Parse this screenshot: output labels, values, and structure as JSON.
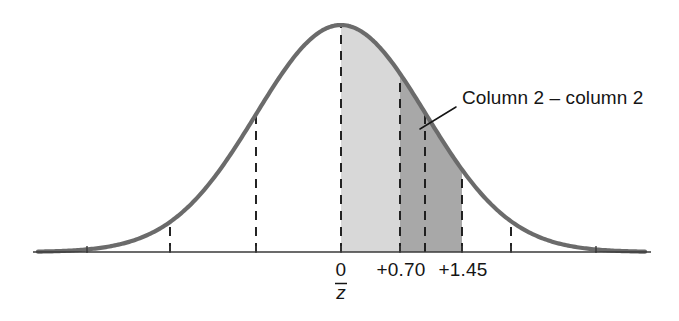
{
  "figure": {
    "background_color": "#ffffff",
    "curve_color": "#6b6b6b",
    "axis_color": "#3a3a3a",
    "dashed_color": "#1a1a1a",
    "light_shade_color": "#d8d8d8",
    "dark_shade_color": "#a8a8a8",
    "text_color": "#151515"
  },
  "annotation": {
    "label": "Column 2 – column 2",
    "leader_from_x": 420,
    "leader_from_y": 129,
    "leader_to_x": 456,
    "leader_to_y": 107,
    "text_x": 462,
    "text_y": 104
  },
  "axis": {
    "label_0": "0",
    "label_070": "+0.70",
    "label_145": "+1.45",
    "mean_symbol": "z",
    "mean_symbol_overbar": "¯",
    "baseline_y": 252,
    "baseline_x_start": 33,
    "baseline_x_end": 651
  },
  "chart_data": {
    "type": "area",
    "xlabel": "",
    "ylabel": "",
    "distribution": "standard normal",
    "mean_label": "z̄",
    "tick_values": [
      -3.0,
      -2.0,
      -1.0,
      0,
      0.7,
      1.45,
      2.0,
      3.0
    ],
    "tick_labels": [
      "",
      "",
      "",
      "0",
      "+0.70",
      "+1.45",
      "",
      ""
    ],
    "tick_pixel_x": [
      87,
      170,
      256,
      341,
      400,
      462,
      511,
      596
    ],
    "dashed_verticals_z": [
      -3.0,
      -2.0,
      -1.0,
      0,
      0.7,
      1.0,
      1.45,
      2.0,
      3.0
    ],
    "dashed_verticals_pixel_x": [
      87,
      170,
      256,
      341,
      400,
      425,
      462,
      511,
      596
    ],
    "shaded_regions": [
      {
        "name": "light-region",
        "from_z": 0,
        "to_z": 0.7,
        "from_pixel_x": 341,
        "to_pixel_x": 400,
        "color": "#d8d8d8",
        "meaning": "column 2 area from 0 to +0.70"
      },
      {
        "name": "dark-region",
        "from_z": 0.7,
        "to_z": 1.45,
        "from_pixel_x": 400,
        "to_pixel_x": 462,
        "color": "#a8a8a8",
        "meaning": "column 2 minus column 2 area from +0.70 to +1.45"
      }
    ],
    "peak_pixel": {
      "x": 341,
      "y": 25
    },
    "pixels_per_sigma": 85,
    "baseline_pixel_y": 252,
    "curve_amplitude_px": 227,
    "grid": false,
    "legend": "none",
    "annotations": [
      {
        "text": "Column 2 – column 2",
        "points_to_z": 0.93
      }
    ]
  }
}
